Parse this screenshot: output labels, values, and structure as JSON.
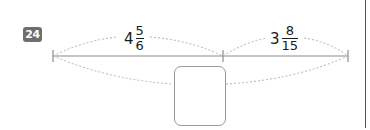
{
  "problem": {
    "number": "24"
  },
  "segments": [
    {
      "label_whole": "4",
      "label_num": "5",
      "label_den": "6"
    },
    {
      "label_whole": "3",
      "label_num": "8",
      "label_den": "15"
    }
  ],
  "answer_box": {
    "value": ""
  },
  "colors": {
    "badge": "#6e6e6e",
    "line": "#8c8c8c",
    "dashed": "#b4b4b4",
    "text": "#1a1a1a"
  }
}
